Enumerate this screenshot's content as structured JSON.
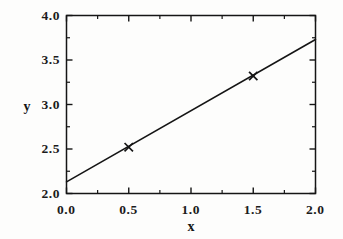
{
  "chart_data": {
    "type": "line",
    "title": "",
    "subtitle": "",
    "xlabel": "x",
    "ylabel": "y",
    "xlim": [
      0.0,
      2.0
    ],
    "ylim": [
      2.0,
      4.0
    ],
    "grid": false,
    "legend": null,
    "x_ticks": [
      "0.0",
      "0.5",
      "1.0",
      "1.5",
      "2.0"
    ],
    "x_tick_values": [
      0.0,
      0.5,
      1.0,
      1.5,
      2.0
    ],
    "x_minor_tick_values": [
      0.25,
      0.75,
      1.25,
      1.75
    ],
    "y_ticks": [
      "2.0",
      "2.5",
      "3.0",
      "3.5",
      "4.0"
    ],
    "y_tick_values": [
      2.0,
      2.5,
      3.0,
      3.5,
      4.0
    ],
    "y_minor_tick_values": [
      2.25,
      2.75,
      3.25,
      3.75
    ],
    "series": [
      {
        "name": "fit-line",
        "type": "line",
        "color": "#151515",
        "linewidth": 1.6,
        "x": [
          0.0,
          2.0
        ],
        "y": [
          2.13,
          3.73
        ]
      },
      {
        "name": "data-points",
        "type": "scatter",
        "marker": "x",
        "color": "#151515",
        "x": [
          0.5,
          1.5
        ],
        "y": [
          2.52,
          3.32
        ]
      }
    ],
    "annotations": []
  },
  "figure": {
    "axis_color": "#151515",
    "background": "#fdfdfc",
    "axis_title_x": "x",
    "axis_title_y": "y"
  }
}
